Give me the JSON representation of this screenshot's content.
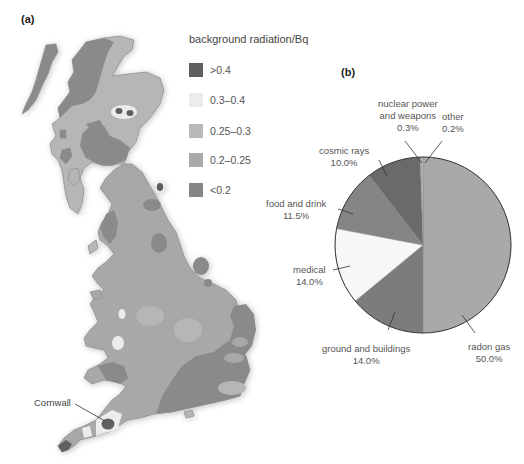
{
  "figure": {
    "panel_a_label": "(a)",
    "panel_b_label": "(b)"
  },
  "map": {
    "region": "Great Britain",
    "callout": "Cornwall",
    "colors": {
      "gt_0_4": "#5f5f5f",
      "0_3_to_0_4": "#ececec",
      "0_25_to_0_3": "#b6b6b6",
      "0_2_to_0_25": "#a8a8a8",
      "lt_0_2": "#8a8a8a"
    }
  },
  "legend": {
    "title": "background radiation/Bq",
    "items": [
      {
        "label": ">0.4",
        "color": "#5f5f5f"
      },
      {
        "label": "0.3–0.4",
        "color": "#ececec"
      },
      {
        "label": "0.25–0.3",
        "color": "#b9b9b9"
      },
      {
        "label": "0.2–0.25",
        "color": "#a9a9a9"
      },
      {
        "label": "<0.2",
        "color": "#858585"
      }
    ]
  },
  "chart_data": {
    "type": "pie",
    "title": "",
    "start_angle": "12 o'clock, clockwise",
    "categories": [
      "radon gas",
      "ground and buildings",
      "medical",
      "food and drink",
      "cosmic rays",
      "nuclear power and weapons",
      "other"
    ],
    "values": [
      50.0,
      14.0,
      14.0,
      11.5,
      10.0,
      0.3,
      0.2
    ],
    "unit": "%",
    "colors": [
      "#a9a9a9",
      "#7c7c7c",
      "#f7f7f7",
      "#858585",
      "#6a6a6a",
      "#bdbdbd",
      "#c9c9c9"
    ],
    "labels": [
      {
        "name": "radon gas",
        "value": "50.0%"
      },
      {
        "name": "ground and buildings",
        "value": "14.0%"
      },
      {
        "name": "medical",
        "value": "14.0%"
      },
      {
        "name": "food and drink",
        "value": "11.5%"
      },
      {
        "name": "cosmic rays",
        "value": "10.0%"
      },
      {
        "name_line1": "nuclear power",
        "name_line2": "and weapons",
        "value": "0.3%"
      },
      {
        "name": "other",
        "value": "0.2%"
      }
    ],
    "legend_position": "none (direct labels with leader lines)"
  }
}
